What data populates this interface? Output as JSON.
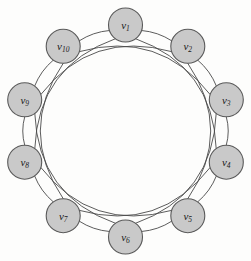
{
  "figure": {
    "background_color": "#fdfdfc",
    "node_fill_color": "#c9c9c9",
    "node_stroke_color": "#5a5a5a",
    "edge_color": "#4a4a4a",
    "label_color": "#1a1a1a"
  },
  "graph": {
    "type": "undirected-graph",
    "layout": "circular",
    "vertex_count": 10,
    "edge_count": 20,
    "degree_per_vertex": 4,
    "center": {
      "x": 125.5,
      "y": 131
    },
    "ring_radius": 106,
    "node_radius": 17,
    "chord_skips": [
      1,
      3
    ],
    "nodes": [
      {
        "id": "v1",
        "label": "v",
        "subscript": "1",
        "x": 125.5,
        "y": 25.0,
        "angle_deg": 270
      },
      {
        "id": "v2",
        "label": "v",
        "subscript": "2",
        "x": 187.8,
        "y": 46.3,
        "angle_deg": 306
      },
      {
        "id": "v3",
        "label": "v",
        "subscript": "3",
        "x": 226.3,
        "y": 99.8,
        "angle_deg": 342
      },
      {
        "id": "v4",
        "label": "v",
        "subscript": "4",
        "x": 226.3,
        "y": 162.2,
        "angle_deg": 18
      },
      {
        "id": "v5",
        "label": "v",
        "subscript": "5",
        "x": 187.8,
        "y": 215.7,
        "angle_deg": 54
      },
      {
        "id": "v6",
        "label": "v",
        "subscript": "6",
        "x": 125.5,
        "y": 237.0,
        "angle_deg": 90
      },
      {
        "id": "v7",
        "label": "v",
        "subscript": "7",
        "x": 63.2,
        "y": 215.7,
        "angle_deg": 126
      },
      {
        "id": "v8",
        "label": "v",
        "subscript": "8",
        "x": 24.7,
        "y": 162.2,
        "angle_deg": 162
      },
      {
        "id": "v9",
        "label": "v",
        "subscript": "9",
        "x": 24.7,
        "y": 99.8,
        "angle_deg": 198
      },
      {
        "id": "v10",
        "label": "v",
        "subscript": "10",
        "x": 63.2,
        "y": 46.3,
        "angle_deg": 234
      }
    ],
    "edges": [
      {
        "from": "v1",
        "to": "v2",
        "skip": 1
      },
      {
        "from": "v2",
        "to": "v3",
        "skip": 1
      },
      {
        "from": "v3",
        "to": "v4",
        "skip": 1
      },
      {
        "from": "v4",
        "to": "v5",
        "skip": 1
      },
      {
        "from": "v5",
        "to": "v6",
        "skip": 1
      },
      {
        "from": "v6",
        "to": "v7",
        "skip": 1
      },
      {
        "from": "v7",
        "to": "v8",
        "skip": 1
      },
      {
        "from": "v8",
        "to": "v9",
        "skip": 1
      },
      {
        "from": "v9",
        "to": "v10",
        "skip": 1
      },
      {
        "from": "v10",
        "to": "v1",
        "skip": 1
      },
      {
        "from": "v1",
        "to": "v4",
        "skip": 3
      },
      {
        "from": "v2",
        "to": "v5",
        "skip": 3
      },
      {
        "from": "v3",
        "to": "v6",
        "skip": 3
      },
      {
        "from": "v4",
        "to": "v7",
        "skip": 3
      },
      {
        "from": "v5",
        "to": "v8",
        "skip": 3
      },
      {
        "from": "v6",
        "to": "v9",
        "skip": 3
      },
      {
        "from": "v7",
        "to": "v10",
        "skip": 3
      },
      {
        "from": "v8",
        "to": "v1",
        "skip": 3
      },
      {
        "from": "v9",
        "to": "v2",
        "skip": 3
      },
      {
        "from": "v10",
        "to": "v3",
        "skip": 3
      }
    ]
  }
}
